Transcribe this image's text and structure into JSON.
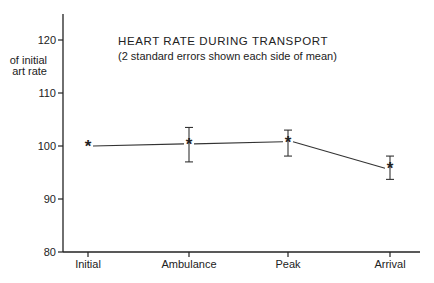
{
  "chart_data": {
    "type": "line",
    "title": "HEART RATE DURING TRANSPORT",
    "subtitle": "(2 standard errors shown each side of mean)",
    "xlabel": "",
    "ylabel": [
      "% of initial",
      "heart rate"
    ],
    "ylabel_visible": [
      "of initial",
      "art rate"
    ],
    "categories": [
      "Initial",
      "Ambulance",
      "Peak",
      "Arrival"
    ],
    "series": [
      {
        "name": "Heart rate (% of initial)",
        "marker": "*",
        "values": [
          100,
          100.4,
          100.8,
          95.8
        ],
        "error_low": [
          null,
          97.0,
          98.1,
          93.7
        ],
        "error_high": [
          null,
          103.5,
          103.0,
          98.1
        ]
      }
    ],
    "yticks": [
      80,
      90,
      100,
      110,
      120
    ],
    "ylim": [
      80,
      125
    ],
    "grid": false,
    "legend": null
  }
}
